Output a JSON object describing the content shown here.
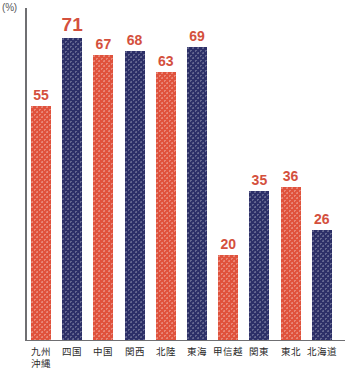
{
  "chart_data": {
    "type": "bar",
    "title": "",
    "subtitle": "",
    "xlabel": "",
    "ylabel": "",
    "unit_label": "(%)",
    "ylim": [
      0,
      79
    ],
    "grid": false,
    "legend": false,
    "categories": [
      "九州\n沖縄",
      "四国",
      "中国",
      "関西",
      "北陸",
      "東海",
      "甲信越",
      "関東",
      "東北",
      "北海道"
    ],
    "values": [
      55,
      71,
      67,
      68,
      63,
      69,
      20,
      35,
      36,
      26
    ],
    "bar_colors": [
      "#e0523c",
      "#2d3068",
      "#e0523c",
      "#2d3068",
      "#e0523c",
      "#2d3068",
      "#e0523c",
      "#2d3068",
      "#e0523c",
      "#2d3068"
    ],
    "value_label_color": "#d4503d",
    "axis_color": "#6f6f72"
  },
  "bars": [
    {
      "label_line1": "九州",
      "label_line2": "沖縄",
      "value": "55",
      "emphasis": false
    },
    {
      "label_line1": "四国",
      "label_line2": "",
      "value": "71",
      "emphasis": true
    },
    {
      "label_line1": "中国",
      "label_line2": "",
      "value": "67",
      "emphasis": false
    },
    {
      "label_line1": "関西",
      "label_line2": "",
      "value": "68",
      "emphasis": false
    },
    {
      "label_line1": "北陸",
      "label_line2": "",
      "value": "63",
      "emphasis": false
    },
    {
      "label_line1": "東海",
      "label_line2": "",
      "value": "69",
      "emphasis": false
    },
    {
      "label_line1": "甲信越",
      "label_line2": "",
      "value": "20",
      "emphasis": false
    },
    {
      "label_line1": "関東",
      "label_line2": "",
      "value": "35",
      "emphasis": false
    },
    {
      "label_line1": "東北",
      "label_line2": "",
      "value": "36",
      "emphasis": false
    },
    {
      "label_line1": "北海道",
      "label_line2": "",
      "value": "26",
      "emphasis": false
    }
  ],
  "axes": {
    "unit": "(%)"
  },
  "corner": {
    "faint_text": ""
  }
}
